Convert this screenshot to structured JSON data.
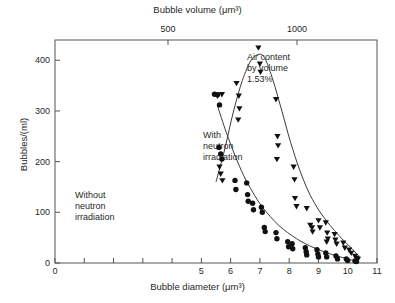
{
  "chart_data": {
    "type": "scatter",
    "title": "",
    "xlabel": "Bubble diameter (μm³)",
    "ylabel": "Bubbles/(ml)",
    "x2label": "Bubble volume (μm³)",
    "xlim": [
      0,
      11
    ],
    "ylim": [
      0,
      440
    ],
    "grid": false,
    "legend_position": "in-plot annotations",
    "xticks": [
      0,
      5,
      6,
      7,
      8,
      9,
      10,
      11
    ],
    "xticklabels": [
      "0",
      "5",
      "6",
      "7",
      "8",
      "9",
      "10",
      "11"
    ],
    "xminorticks": [
      1,
      2,
      3,
      4
    ],
    "yticks": [
      0,
      100,
      200,
      300,
      400
    ],
    "yticklabels": [
      "0",
      "100",
      "200",
      "300",
      "400"
    ],
    "yminorticks": [],
    "x2ticks_labels": [
      "500",
      "1000"
    ],
    "x2ticks_diameter": [
      9.85,
      12.41
    ],
    "x2ticks_px": [
      168,
      297
    ],
    "annotations": [
      {
        "name": "air-content",
        "text": "Air content\nby volume\n1.53%",
        "x": 9.4,
        "y": 395
      },
      {
        "name": "with-neutron-irradiation",
        "text": "With\nneutron\nirradiation",
        "x": 8.1,
        "y": 263
      },
      {
        "name": "without-neutron-irradiation",
        "text": "Without\nneutron\nirradiation",
        "x": 5.6,
        "y": 145
      }
    ],
    "series": [
      {
        "name": "With neutron irradiation",
        "marker": "triangle-down",
        "color": "#111111",
        "points": [
          [
            5.55,
            330
          ],
          [
            5.7,
            333
          ],
          [
            5.62,
            190
          ],
          [
            5.66,
            176
          ],
          [
            5.72,
            163
          ],
          [
            6.2,
            355
          ],
          [
            6.28,
            330
          ],
          [
            6.3,
            305
          ],
          [
            6.26,
            283
          ],
          [
            6.95,
            425
          ],
          [
            7.0,
            393
          ],
          [
            7.02,
            377
          ],
          [
            7.55,
            323
          ],
          [
            7.6,
            250
          ],
          [
            7.62,
            232
          ],
          [
            7.58,
            205
          ],
          [
            8.15,
            190
          ],
          [
            8.18,
            165
          ],
          [
            8.2,
            128
          ],
          [
            8.25,
            112
          ],
          [
            8.6,
            108
          ],
          [
            8.72,
            75
          ],
          [
            8.78,
            70
          ],
          [
            8.8,
            62
          ],
          [
            9.0,
            84
          ],
          [
            9.05,
            70
          ],
          [
            9.25,
            80
          ],
          [
            9.3,
            60
          ],
          [
            9.32,
            48
          ],
          [
            9.28,
            42
          ],
          [
            9.55,
            57
          ],
          [
            9.58,
            46
          ],
          [
            9.62,
            38
          ],
          [
            9.85,
            40
          ],
          [
            9.9,
            30
          ],
          [
            10.05,
            26
          ],
          [
            10.12,
            20
          ],
          [
            10.25,
            14
          ],
          [
            10.3,
            10
          ],
          [
            10.35,
            8
          ]
        ],
        "curve": [
          [
            5.5,
            160
          ],
          [
            5.8,
            225
          ],
          [
            6.1,
            300
          ],
          [
            6.4,
            360
          ],
          [
            6.7,
            400
          ],
          [
            7.0,
            412
          ],
          [
            7.2,
            400
          ],
          [
            7.45,
            360
          ],
          [
            7.75,
            300
          ],
          [
            8.05,
            238
          ],
          [
            8.35,
            185
          ],
          [
            8.65,
            142
          ],
          [
            8.95,
            110
          ],
          [
            9.25,
            85
          ],
          [
            9.55,
            64
          ],
          [
            9.85,
            45
          ],
          [
            10.15,
            28
          ],
          [
            10.4,
            12
          ]
        ]
      },
      {
        "name": "Without neutron irradiation",
        "marker": "circle",
        "color": "#111111",
        "points": [
          [
            5.45,
            333
          ],
          [
            5.55,
            332
          ],
          [
            5.62,
            312
          ],
          [
            5.6,
            228
          ],
          [
            5.66,
            215
          ],
          [
            5.7,
            205
          ],
          [
            6.15,
            163
          ],
          [
            6.18,
            145
          ],
          [
            6.55,
            158
          ],
          [
            6.58,
            135
          ],
          [
            6.6,
            122
          ],
          [
            6.75,
            118
          ],
          [
            6.78,
            105
          ],
          [
            7.05,
            110
          ],
          [
            7.08,
            100
          ],
          [
            7.15,
            70
          ],
          [
            7.18,
            62
          ],
          [
            7.55,
            60
          ],
          [
            7.58,
            48
          ],
          [
            7.95,
            42
          ],
          [
            7.98,
            32
          ],
          [
            8.1,
            38
          ],
          [
            8.12,
            28
          ],
          [
            8.55,
            30
          ],
          [
            8.58,
            22
          ],
          [
            8.6,
            16
          ],
          [
            8.95,
            26
          ],
          [
            8.98,
            18
          ],
          [
            9.0,
            12
          ],
          [
            9.25,
            20
          ],
          [
            9.28,
            12
          ],
          [
            9.6,
            14
          ],
          [
            9.65,
            8
          ],
          [
            9.95,
            8
          ],
          [
            10.0,
            5
          ],
          [
            10.25,
            4
          ],
          [
            10.3,
            3
          ]
        ],
        "curve": [
          [
            5.55,
            310
          ],
          [
            5.85,
            258
          ],
          [
            6.15,
            212
          ],
          [
            6.45,
            172
          ],
          [
            6.75,
            140
          ],
          [
            7.05,
            113
          ],
          [
            7.35,
            92
          ],
          [
            7.65,
            74
          ],
          [
            7.95,
            60
          ],
          [
            8.25,
            48
          ],
          [
            8.55,
            38
          ],
          [
            8.85,
            30
          ],
          [
            9.15,
            23
          ],
          [
            9.45,
            17
          ],
          [
            9.75,
            12
          ],
          [
            10.05,
            7
          ],
          [
            10.35,
            3
          ]
        ]
      }
    ]
  },
  "figure": {
    "plot_left_px": 55,
    "plot_right_px": 377,
    "plot_top_px": 40,
    "plot_bottom_px": 263
  }
}
